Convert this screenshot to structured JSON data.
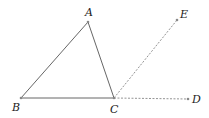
{
  "diagram": {
    "points": {
      "A": {
        "label": "A",
        "x": 88,
        "y": 22,
        "lx": 85,
        "ly": 16
      },
      "B": {
        "label": "B",
        "x": 21,
        "y": 98,
        "lx": 12,
        "ly": 111
      },
      "C": {
        "label": "C",
        "x": 114,
        "y": 98,
        "lx": 110,
        "ly": 113
      },
      "D": {
        "label": "D",
        "x": 188,
        "y": 99,
        "lx": 192,
        "ly": 103
      },
      "E": {
        "label": "E",
        "x": 177,
        "y": 20,
        "lx": 180,
        "ly": 18
      }
    },
    "solid_segments": [
      [
        "A",
        "B"
      ],
      [
        "B",
        "C"
      ],
      [
        "A",
        "C"
      ]
    ],
    "dashed_rays": [
      [
        "C",
        "E"
      ],
      [
        "C",
        "D"
      ]
    ],
    "colors": {
      "line": "#555555",
      "dashed": "#777777",
      "point": "#888888"
    }
  }
}
